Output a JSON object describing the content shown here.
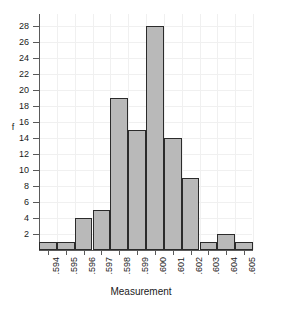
{
  "chart_data": {
    "type": "bar",
    "title": "",
    "xlabel": "Measurement",
    "ylabel": "f",
    "categories": [
      ".594",
      ".595",
      ".596",
      ".597",
      ".598",
      ".599",
      ".600",
      ".601",
      ".602",
      ".603",
      ".604",
      ".605"
    ],
    "values": [
      1,
      1,
      4,
      5,
      19,
      15,
      28,
      14,
      9,
      1,
      2,
      1
    ],
    "yticks": [
      2,
      4,
      6,
      8,
      10,
      12,
      14,
      16,
      18,
      20,
      22,
      24,
      26,
      28
    ],
    "ylim": [
      0,
      29.5
    ],
    "grid": true,
    "legend": null,
    "bar_fill_color": "#b9b9b9",
    "bar_edge_color": "#2b2b2b",
    "grid_color": "#f0f0f0",
    "axis_color": "#5a5a5a",
    "background_color": "#ffffff"
  }
}
